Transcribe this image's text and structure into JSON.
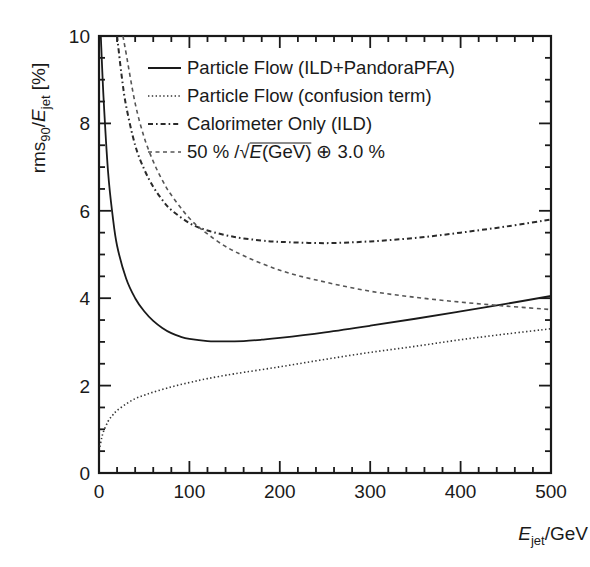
{
  "chart_data": {
    "type": "line",
    "title": "",
    "xlabel": "E_jet/GeV",
    "xlabel_parts": {
      "main": "E",
      "sub": "jet",
      "rest": "/GeV"
    },
    "ylabel": "rms90/E_jet [%]",
    "ylabel_parts": {
      "pre": "rms",
      "sub1": "90",
      "mid": "/",
      "main": "E",
      "sub2": "jet",
      "rest": " [%]"
    },
    "xlim": [
      0,
      500
    ],
    "ylim": [
      0,
      10
    ],
    "x_ticks": [
      0,
      100,
      200,
      300,
      400,
      500
    ],
    "x_tick_labels": [
      "0",
      "100",
      "200",
      "300",
      "400",
      "500"
    ],
    "x_minor_step": 20,
    "y_ticks": [
      0,
      2,
      4,
      6,
      8,
      10
    ],
    "y_tick_labels": [
      "0",
      "2",
      "4",
      "6",
      "8",
      "10"
    ],
    "y_minor_step": 0.5,
    "grid": false,
    "legend_position": "upper-right",
    "series": [
      {
        "name": "Particle Flow (ILD+PandoraPFA)",
        "style": "solid",
        "color": "#1a1a1a",
        "x": [
          2,
          5,
          10,
          15,
          20,
          30,
          40,
          50,
          60,
          70,
          80,
          90,
          100,
          120,
          140,
          160,
          180,
          200,
          250,
          300,
          350,
          400,
          450,
          500
        ],
        "y": [
          10.0,
          8.6,
          6.9,
          5.9,
          5.2,
          4.45,
          4.0,
          3.7,
          3.48,
          3.32,
          3.2,
          3.12,
          3.07,
          3.02,
          3.01,
          3.02,
          3.05,
          3.09,
          3.22,
          3.37,
          3.53,
          3.7,
          3.87,
          4.05
        ]
      },
      {
        "name": "Particle Flow (confusion term)",
        "style": "dotted",
        "color": "#333333",
        "x": [
          1,
          3,
          5,
          10,
          15,
          20,
          30,
          40,
          50,
          60,
          80,
          100,
          120,
          150,
          200,
          250,
          300,
          350,
          400,
          450,
          500
        ],
        "y": [
          0.6,
          0.8,
          0.95,
          1.18,
          1.32,
          1.43,
          1.58,
          1.7,
          1.78,
          1.85,
          1.97,
          2.07,
          2.16,
          2.27,
          2.43,
          2.6,
          2.76,
          2.9,
          3.05,
          3.18,
          3.3
        ]
      },
      {
        "name": "Calorimeter Only (ILD)",
        "style": "dash-dot",
        "color": "#2a2a2a",
        "x": [
          20,
          25,
          30,
          40,
          50,
          60,
          70,
          80,
          100,
          120,
          150,
          180,
          200,
          250,
          300,
          350,
          400,
          450,
          500
        ],
        "y": [
          10.0,
          9.1,
          8.4,
          7.5,
          6.95,
          6.55,
          6.25,
          6.02,
          5.72,
          5.55,
          5.4,
          5.32,
          5.29,
          5.26,
          5.3,
          5.38,
          5.5,
          5.64,
          5.8
        ]
      },
      {
        "name": "50 % /√E(GeV) ⊕ 3.0 %",
        "style": "dashed",
        "color": "#555555",
        "x": [
          26.5,
          30,
          40,
          50,
          60,
          70,
          80,
          100,
          120,
          150,
          200,
          250,
          300,
          350,
          400,
          450,
          500
        ],
        "y": [
          10.0,
          9.6,
          8.46,
          7.68,
          7.13,
          6.7,
          6.36,
          5.83,
          5.47,
          5.07,
          4.64,
          4.37,
          4.16,
          4.02,
          3.91,
          3.82,
          3.74
        ]
      }
    ]
  },
  "legend": {
    "items": [
      {
        "label": "Particle Flow (ILD+PandoraPFA)",
        "style": "solid"
      },
      {
        "label": "Particle Flow (confusion term)",
        "style": "dotted"
      },
      {
        "label": "Calorimeter Only (ILD)",
        "style": "dash-dot"
      },
      {
        "label_parts": {
          "pre": "50 % /",
          "sqrt_main": "E",
          "sqrt_rest": "(GeV)",
          "post": " ⊕ 3.0 %"
        },
        "style": "dashed"
      }
    ]
  }
}
